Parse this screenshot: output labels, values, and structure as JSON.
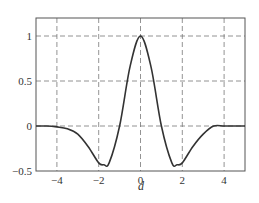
{
  "chart_data": {
    "type": "line",
    "title": "",
    "xlabel": "d",
    "ylabel": "",
    "xlim": [
      -5,
      5
    ],
    "ylim": [
      -0.5,
      1.2
    ],
    "grid": true,
    "xticks": [
      -4,
      -2,
      0,
      2,
      4
    ],
    "xtick_labels": [
      "−4",
      "−2",
      "0",
      "2",
      "4"
    ],
    "yticks": [
      -0.5,
      0,
      0.5,
      1
    ],
    "ytick_labels": [
      "−0.5",
      "0",
      "0.5",
      "1"
    ],
    "series": [
      {
        "name": "f(d)",
        "color": "#333333",
        "x": [
          -5,
          -4.5,
          -4,
          -3.5,
          -3,
          -2.5,
          -2,
          -1.75,
          -1.5,
          -1,
          -0.5,
          0,
          0.5,
          1,
          1.5,
          1.75,
          2,
          2.5,
          3,
          3.5,
          4,
          4.5,
          5
        ],
        "y": [
          0,
          0,
          -0.01,
          -0.03,
          -0.09,
          -0.23,
          -0.41,
          -0.43,
          -0.41,
          0,
          0.66,
          1,
          0.66,
          0,
          -0.41,
          -0.43,
          -0.41,
          -0.23,
          -0.09,
          0,
          0,
          0,
          0
        ]
      }
    ]
  }
}
